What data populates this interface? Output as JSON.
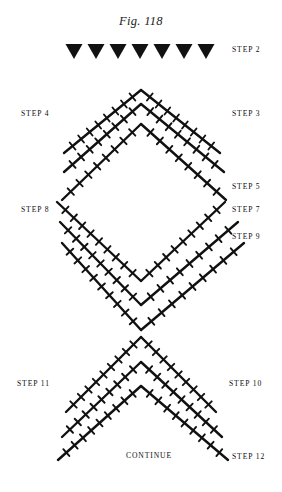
{
  "figure": {
    "title": "Fig. 118",
    "caption_note": "CONTINUE",
    "ink_color": "#111111",
    "background_color": "#ffffff"
  },
  "arrow_row": {
    "icon": "down-triangle-icon",
    "count": 7,
    "x_positions": [
      74,
      96,
      118,
      140,
      162,
      184,
      206
    ],
    "y": 44,
    "width": 17,
    "height": 15
  },
  "labels": [
    {
      "id": "step-2",
      "text": "STEP 2",
      "x": 232,
      "y": 45,
      "side": "right"
    },
    {
      "id": "step-4",
      "text": "STEP 4",
      "x": 21,
      "y": 109,
      "side": "left"
    },
    {
      "id": "step-3",
      "text": "STEP 3",
      "x": 232,
      "y": 109,
      "side": "right"
    },
    {
      "id": "step-5",
      "text": "STEP 5",
      "x": 232,
      "y": 182,
      "side": "right"
    },
    {
      "id": "step-8",
      "text": "STEP 8",
      "x": 21,
      "y": 205,
      "side": "left"
    },
    {
      "id": "step-7",
      "text": "STEP 7",
      "x": 232,
      "y": 205,
      "side": "right"
    },
    {
      "id": "step-9",
      "text": "STEP 9",
      "x": 232,
      "y": 232,
      "side": "right"
    },
    {
      "id": "step-11",
      "text": "STEP 11",
      "x": 17,
      "y": 379,
      "side": "left"
    },
    {
      "id": "step-10",
      "text": "STEP 10",
      "x": 229,
      "y": 379,
      "side": "right"
    },
    {
      "id": "continue",
      "text": "CONTINUE",
      "x": 126,
      "y": 451,
      "side": "center"
    },
    {
      "id": "step-12",
      "text": "STEP 12",
      "x": 232,
      "y": 452,
      "side": "right"
    }
  ],
  "chart_data": {
    "type": "diagram",
    "stroke_width": 2.4,
    "tick_length": 9,
    "tick_width": 1.9,
    "apex_x": 141,
    "chevrons": [
      {
        "name": "row-step-3-4",
        "apex_y": 90,
        "left_x": 64,
        "right_x": 220,
        "end_y": 153,
        "ticks": 8
      },
      {
        "name": "row-step-5",
        "apex_y": 104,
        "left_x": 64,
        "right_x": 224,
        "end_y": 172,
        "ticks": 8
      },
      {
        "name": "row-step-7",
        "apex_y": 124,
        "left_x": 62,
        "right_x": 226,
        "end_y": 200,
        "ticks": 8
      }
    ],
    "vees": [
      {
        "name": "row-step-8-9-upper",
        "vertex_y": 281,
        "left_x": 57,
        "right_x": 225,
        "top_y": 202,
        "ticks": 9
      },
      {
        "name": "row-step-9-mid",
        "vertex_y": 305,
        "left_x": 60,
        "right_x": 238,
        "top_y": 222,
        "ticks": 9
      },
      {
        "name": "row-step-9-lower",
        "vertex_y": 330,
        "left_x": 62,
        "right_x": 244,
        "top_y": 243,
        "ticks": 9
      }
    ],
    "lower_chevrons": [
      {
        "name": "row-step-10-11",
        "apex_y": 337,
        "left_x": 66,
        "right_x": 216,
        "end_y": 412,
        "ticks": 9
      },
      {
        "name": "row-step-10-mid",
        "apex_y": 362,
        "left_x": 62,
        "right_x": 222,
        "end_y": 437,
        "ticks": 9
      },
      {
        "name": "row-step-12",
        "apex_y": 386,
        "left_x": 58,
        "right_x": 228,
        "end_y": 460,
        "ticks": 9
      }
    ]
  }
}
